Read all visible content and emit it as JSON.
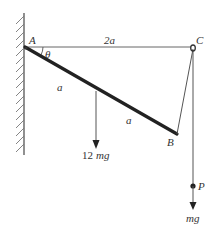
{
  "diagram": {
    "type": "statics-rod-string",
    "colors": {
      "line": "#555555",
      "rod": "#222222",
      "text": "#333333"
    },
    "points": {
      "A": {
        "label": "A",
        "x": 25,
        "y": 47
      },
      "B": {
        "label": "B",
        "x": 177,
        "y": 134
      },
      "C": {
        "label": "C",
        "x": 193,
        "y": 47
      },
      "P": {
        "label": "P",
        "x": 193,
        "y": 186
      }
    },
    "labels": {
      "AC_length": "2a",
      "angle": "θ",
      "segment_upper": "a",
      "segment_lower": "a",
      "rod_weight_num": "12",
      "rod_weight_var": "mg",
      "particle_weight": "mg"
    }
  }
}
